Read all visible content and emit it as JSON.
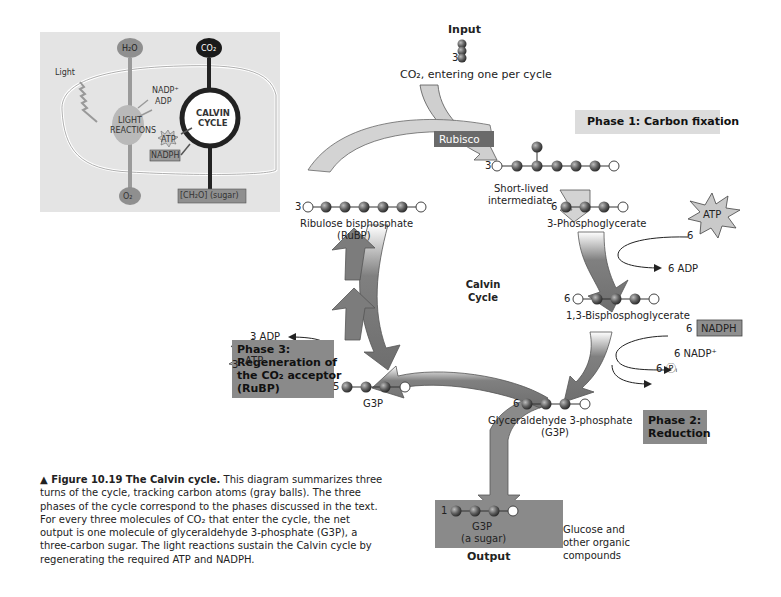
{
  "inset": {
    "h2o": "H₂O",
    "co2": "CO₂",
    "light": "Light",
    "nadp_plus": "NADP⁺",
    "adp": "ADP",
    "light_reactions_1": "LIGHT",
    "light_reactions_2": "REACTIONS",
    "atp": "ATP",
    "nadph": "NADPH",
    "calvin_1": "CALVIN",
    "calvin_2": "CYCLE",
    "o2": "O₂",
    "sugar": "[CH₂O] (sugar)"
  },
  "input": {
    "title": "Input",
    "count": "3",
    "label": "CO₂, entering one per cycle"
  },
  "enzyme": "Rubisco",
  "center_label_1": "Calvin",
  "center_label_2": "Cycle",
  "phases": {
    "phase1": "Phase 1: Carbon fixation",
    "phase2_line1": "Phase 2:",
    "phase2_line2": "Reduction",
    "phase3_line1": "Phase 3:",
    "phase3_line2": "Regeneration of",
    "phase3_line3": "the CO₂ acceptor",
    "phase3_line4": "(RuBP)"
  },
  "molecules": {
    "intermediate_count": "3",
    "intermediate_label_1": "Short-lived",
    "intermediate_label_2": "intermediate",
    "pga_count": "6",
    "pga_label": "3-Phosphoglycerate",
    "bpg_count": "6",
    "bpg_label": "1,3-Bisphosphoglycerate",
    "g3p_count": "6",
    "g3p_label_1": "Glyceraldehyde 3-phosphate",
    "g3p_label_2": "(G3P)",
    "g3p5_count": "5",
    "g3p5_label": "G3P",
    "rubp_count": "3",
    "rubp_label_1": "Ribulose bisphosphate",
    "rubp_label_2": "(RuBP)"
  },
  "cofactors": {
    "atp6_count": "6",
    "atp6": "ATP",
    "adp6": "6 ADP",
    "nadph6_count": "6",
    "nadph6": "NADPH",
    "nadp6": "6 NADP⁺",
    "pi6": "6 Ⓟᵢ",
    "atp3_count": "3",
    "atp3": "ATP",
    "adp3": "3 ADP"
  },
  "output": {
    "count": "1",
    "label_1": "G3P",
    "label_2": "(a sugar)",
    "title": "Output",
    "destination_1": "Glucose and",
    "destination_2": "other organic",
    "destination_3": "compounds"
  },
  "caption": {
    "figure": "▲ Figure 10.19",
    "title": "The Calvin cycle.",
    "body": "This diagram summarizes three turns of the cycle, tracking carbon atoms (gray balls). The three phases of the cycle correspond to the phases discussed in the text. For every three molecules of CO₂ that enter the cycle, the net output is one molecule of glyceraldehyde 3-phosphate (G3P), a three-carbon sugar. The light reactions sustain the Calvin cycle by regenerating the required ATP and NADPH."
  },
  "colors": {
    "arrow_dark": "#7a7a7a",
    "arrow_light": "#c9c9c9",
    "phase_box": "#8a8a8a",
    "phase1_box": "#dcdcdc",
    "inset_bg": "#e6e6e6",
    "carbon_ball": "#5a5a5a"
  }
}
